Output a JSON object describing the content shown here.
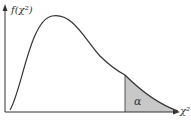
{
  "diagram": {
    "y_axis_label": "f(χ²)",
    "x_axis_label": "χ²",
    "shaded_region_label": "α",
    "colors": {
      "curve": "#333333",
      "axes": "#333333",
      "shade": "#c8c8c8"
    }
  }
}
